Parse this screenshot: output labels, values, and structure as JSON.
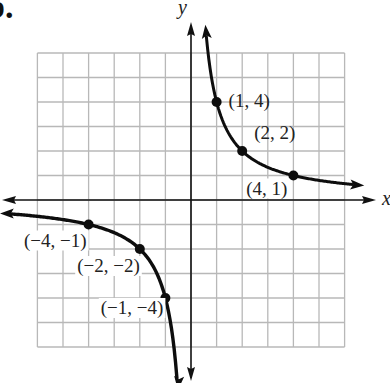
{
  "part_label": "b.",
  "chart_data": {
    "type": "line",
    "title": "",
    "xlabel": "x",
    "ylabel": "y",
    "xlim": [
      -6,
      6
    ],
    "ylim": [
      -6,
      6
    ],
    "grid": true,
    "function": "y = 4/x",
    "series": [
      {
        "name": "branch-quadrant-I",
        "points": [
          {
            "x": 1,
            "y": 4,
            "label": "(1, 4)"
          },
          {
            "x": 2,
            "y": 2,
            "label": "(2, 2)"
          },
          {
            "x": 4,
            "y": 1,
            "label": "(4, 1)"
          }
        ]
      },
      {
        "name": "branch-quadrant-III",
        "points": [
          {
            "x": -4,
            "y": -1,
            "label": "(−4, −1)"
          },
          {
            "x": -2,
            "y": -2,
            "label": "(−2, −2)"
          },
          {
            "x": -1,
            "y": -4,
            "label": "(−1, −4)"
          }
        ]
      }
    ]
  },
  "colors": {
    "grid": "#b8b8b8",
    "axis": "#111111",
    "curve": "#0d0d0d"
  }
}
